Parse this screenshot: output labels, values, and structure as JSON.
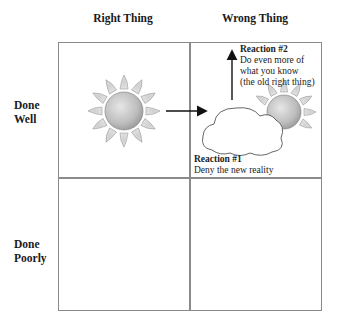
{
  "columns": [
    {
      "label": "Right Thing"
    },
    {
      "label": "Wrong Thing"
    }
  ],
  "rows": [
    {
      "label_line1": "Done",
      "label_line2": "Well"
    },
    {
      "label_line1": "Done",
      "label_line2": "Poorly"
    }
  ],
  "cells": {
    "right_well": {
      "content": "sun-icon"
    },
    "wrong_well": {
      "content": [
        "sun-icon",
        "cloud-icon"
      ],
      "reaction1": {
        "title": "Reaction #1",
        "text": "Deny the new reality"
      },
      "reaction2": {
        "title": "Reaction #2",
        "line1": "Do even more of",
        "line2": "what you know",
        "line3": "(the old right thing)"
      }
    },
    "right_poorly": {
      "content": ""
    },
    "wrong_poorly": {
      "content": ""
    }
  },
  "colors": {
    "grid": "#8a8a8a",
    "sun_body": "#c8c8c8",
    "sun_ray": "#dcdcdc",
    "arrow": "#111111"
  }
}
